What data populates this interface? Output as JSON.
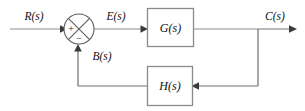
{
  "diagram": {
    "type": "control-system-block-diagram",
    "signals": {
      "input": "R(s)",
      "error": "E(s)",
      "output": "C(s)",
      "feedback": "B(s)"
    },
    "blocks": {
      "forward": "G(s)",
      "feedback": "H(s)"
    },
    "summing_junction": {
      "positive_sign": "+",
      "negative_sign": "−"
    },
    "colors": {
      "wire": "#8d8d8d",
      "block_border": "#8a8a8a",
      "block_fill": "#ffffff",
      "text": "#111111",
      "background": "#ffffff",
      "arrow": "#3a3a3a"
    }
  }
}
